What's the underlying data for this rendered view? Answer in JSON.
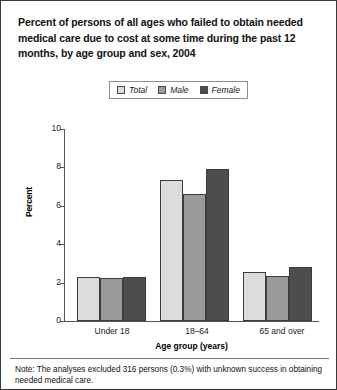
{
  "figure": {
    "title": "Percent of persons of all ages who failed to obtain needed medical care due to cost at some time during the past 12 months, by age group and sex, 2004",
    "note": "Note: The analyses excluded 316 persons (0.3%) with unknown success in obtaining needed medical care."
  },
  "legend": {
    "entries": [
      {
        "label": "Total",
        "color": "#dcdcdc"
      },
      {
        "label": "Male",
        "color": "#9a9a9a"
      },
      {
        "label": "Female",
        "color": "#4d4d4d"
      }
    ]
  },
  "axes": {
    "ylabel": "Percent",
    "xlabel": "Age group (years)",
    "yticks": [
      "0",
      "2",
      "4",
      "6",
      "8",
      "10"
    ]
  },
  "chart_data": {
    "type": "bar",
    "title": "Percent of persons of all ages who failed to obtain needed medical care due to cost at some time during the past 12 months, by age group and sex, 2004",
    "xlabel": "Age group (years)",
    "ylabel": "Percent",
    "ylim": [
      0,
      10
    ],
    "ytick_values": [
      0,
      2,
      4,
      6,
      8,
      10
    ],
    "grid": false,
    "legend_position": "top-center",
    "categories": [
      "Under 18",
      "18–64",
      "65 and over"
    ],
    "series": [
      {
        "name": "Total",
        "color": "#dcdcdc",
        "values": [
          2.3,
          7.35,
          2.55
        ]
      },
      {
        "name": "Male",
        "color": "#9a9a9a",
        "values": [
          2.25,
          6.6,
          2.35
        ]
      },
      {
        "name": "Female",
        "color": "#4d4d4d",
        "values": [
          2.3,
          7.9,
          2.8
        ]
      }
    ],
    "annotations": [
      "Note: The analyses excluded 316 persons (0.3%) with unknown success in obtaining needed medical care."
    ]
  }
}
